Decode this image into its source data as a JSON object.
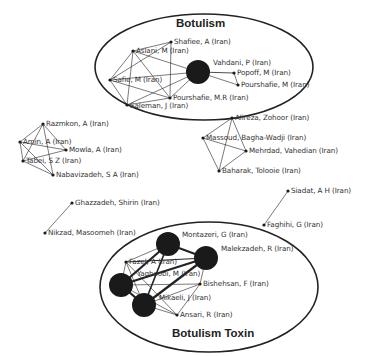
{
  "clusters": [
    {
      "id": "botulism",
      "title": "Botulism",
      "ellipse": {
        "cx": 204,
        "cy": 67,
        "rx": 109,
        "ry": 53
      }
    },
    {
      "id": "botulism-toxin",
      "title": "Botulism Toxin",
      "ellipse": {
        "cx": 209,
        "cy": 287,
        "rx": 109,
        "ry": 65
      }
    }
  ],
  "nodes": [
    {
      "id": "shafiee",
      "label": "Shafiee, A (Iran)",
      "x": 171,
      "y": 42,
      "r": 1.6
    },
    {
      "id": "aslani",
      "label": "Aslani, M (Iran)",
      "x": 133,
      "y": 51,
      "r": 1.6
    },
    {
      "id": "vahdani",
      "label": "Vahdani, P (Iran)",
      "x": 198,
      "y": 72,
      "r": 12
    },
    {
      "id": "popoff",
      "label": "Popoff, M (Iran)",
      "x": 234,
      "y": 73,
      "r": 1.6
    },
    {
      "id": "pourshafie_m",
      "label": "Pourshafie, M (Iran)",
      "x": 238,
      "y": 85,
      "r": 1.6
    },
    {
      "id": "safie",
      "label": "Safie, M (Iran)",
      "x": 110,
      "y": 80,
      "r": 1.6
    },
    {
      "id": "pourshafie_mr",
      "label": "Pourshafie, M.R (Iran)",
      "x": 170,
      "y": 98,
      "r": 1.6
    },
    {
      "id": "saleman",
      "label": "Saleman, J (Iran)",
      "x": 127,
      "y": 105,
      "r": 1.6
    },
    {
      "id": "alireza",
      "label": "Alireza, Zohoor (Iran)",
      "x": 232,
      "y": 118,
      "r": 1.6
    },
    {
      "id": "massoud",
      "label": "Massoud, Bagha-Wadji (Iran)",
      "x": 203,
      "y": 138,
      "r": 1.6
    },
    {
      "id": "mehrdad",
      "label": "Mehrdad, Vahedian (Iran)",
      "x": 246,
      "y": 151,
      "r": 1.6
    },
    {
      "id": "baharak",
      "label": "Baharak, Tolooie (Iran)",
      "x": 219,
      "y": 171,
      "r": 1.6
    },
    {
      "id": "razmkon",
      "label": "Razmkon, A (Iran)",
      "x": 43,
      "y": 124,
      "r": 1.6
    },
    {
      "id": "amin",
      "label": "Amin, A (Iran)",
      "x": 20,
      "y": 142,
      "r": 1.6
    },
    {
      "id": "mowla",
      "label": "Mowla, A (Iran)",
      "x": 66,
      "y": 150,
      "r": 1.6
    },
    {
      "id": "tabei",
      "label": "Tabei, S Z (Iran)",
      "x": 23,
      "y": 161,
      "r": 1.6
    },
    {
      "id": "nabavizadeh",
      "label": "Nabavizadeh, S A (Iran)",
      "x": 53,
      "y": 175,
      "r": 1.6
    },
    {
      "id": "ghazzadeh",
      "label": "Ghazzadeh, Shirin (Iran)",
      "x": 72,
      "y": 203,
      "r": 1.6
    },
    {
      "id": "nikzad",
      "label": "Nikzad, Masoomeh (Iran)",
      "x": 45,
      "y": 233,
      "r": 1.6
    },
    {
      "id": "siadat",
      "label": "Siadat, A H (Iran)",
      "x": 288,
      "y": 191,
      "r": 1.6
    },
    {
      "id": "faghihi",
      "label": "Faghihi, G (Iran)",
      "x": 264,
      "y": 225,
      "r": 1.6
    },
    {
      "id": "montazeri",
      "label": "Montazeri, G (Iran)",
      "x": 168,
      "y": 244,
      "r": 12
    },
    {
      "id": "malekzadeh",
      "label": "Malekzadeh, R (Iran)",
      "x": 206,
      "y": 258,
      "r": 12
    },
    {
      "id": "fazel",
      "label": "Fazel, A (Iran)",
      "x": 126,
      "y": 262,
      "r": 1.6
    },
    {
      "id": "yaghoobi",
      "label": "Yaghoobi, M (Iran)",
      "x": 121,
      "y": 285,
      "r": 12
    },
    {
      "id": "bishehsan",
      "label": "Bishehsan, F (Iran)",
      "x": 200,
      "y": 284,
      "r": 1.6
    },
    {
      "id": "mikaeli",
      "label": "Mikaeli, J (Iran)",
      "x": 144,
      "y": 305,
      "r": 12
    },
    {
      "id": "ansari",
      "label": "Ansari, R (Iran)",
      "x": 177,
      "y": 315,
      "r": 1.6
    }
  ],
  "labels": [
    {
      "node": "shafiee",
      "text": "Shafiee, A (Iran)",
      "x": 174,
      "y": 38
    },
    {
      "node": "aslani",
      "text": "Aslani, M (Iran)",
      "x": 136,
      "y": 47
    },
    {
      "node": "vahdani",
      "text": "Vahdani, P (Iran)",
      "x": 213,
      "y": 59
    },
    {
      "node": "popoff",
      "text": "Popoff, M (Iran)",
      "x": 237,
      "y": 69
    },
    {
      "node": "pourshafie_m",
      "text": "Pourshafie, M (Iran)",
      "x": 241,
      "y": 81
    },
    {
      "node": "safie",
      "text": "Safie, M (Iran)",
      "x": 113,
      "y": 76
    },
    {
      "node": "pourshafie_mr",
      "text": "Pourshafie, M.R (Iran)",
      "x": 173,
      "y": 94
    },
    {
      "node": "saleman",
      "text": "Saleman, J (Iran)",
      "x": 130,
      "y": 102
    },
    {
      "node": "alireza",
      "text": "Alireza, Zohoor (Iran)",
      "x": 235,
      "y": 114
    },
    {
      "node": "massoud",
      "text": "Massoud, Bagha-Wadji (Iran)",
      "x": 206,
      "y": 134
    },
    {
      "node": "mehrdad",
      "text": "Mehrdad, Vahedian (Iran)",
      "x": 249,
      "y": 147
    },
    {
      "node": "baharak",
      "text": "Baharak, Tolooie (Iran)",
      "x": 222,
      "y": 167
    },
    {
      "node": "razmkon",
      "text": "Razmkon, A (Iran)",
      "x": 46,
      "y": 120
    },
    {
      "node": "amin",
      "text": "Amin, A (Iran)",
      "x": 23,
      "y": 138
    },
    {
      "node": "mowla",
      "text": "Mowla, A (Iran)",
      "x": 69,
      "y": 146
    },
    {
      "node": "tabei",
      "text": "Tabei, S Z (Iran)",
      "x": 26,
      "y": 157
    },
    {
      "node": "nabavizadeh",
      "text": "Nabavizadeh, S A (Iran)",
      "x": 56,
      "y": 171
    },
    {
      "node": "ghazzadeh",
      "text": "Ghazzadeh, Shirin (Iran)",
      "x": 75,
      "y": 199
    },
    {
      "node": "nikzad",
      "text": "Nikzad, Masoomeh (Iran)",
      "x": 48,
      "y": 229
    },
    {
      "node": "siadat",
      "text": "Siadat, A H (Iran)",
      "x": 291,
      "y": 187
    },
    {
      "node": "faghihi",
      "text": "Faghihi, G (Iran)",
      "x": 267,
      "y": 221
    },
    {
      "node": "montazeri",
      "text": "Montazeri, G (Iran)",
      "x": 182,
      "y": 231
    },
    {
      "node": "malekzadeh",
      "text": "Malekzadeh, R (Iran)",
      "x": 221,
      "y": 245
    },
    {
      "node": "fazel",
      "text": "Fazel, A (Iran)",
      "x": 129,
      "y": 258
    },
    {
      "node": "yaghoobi",
      "text": "Yaghoobi, M (Iran)",
      "x": 137,
      "y": 270
    },
    {
      "node": "bishehsan",
      "text": "Bishehsan, F (Iran)",
      "x": 203,
      "y": 280
    },
    {
      "node": "mikaeli",
      "text": "Mikaeli, J (Iran)",
      "x": 159,
      "y": 294
    },
    {
      "node": "ansari",
      "text": "Ansari, R (Iran)",
      "x": 180,
      "y": 311
    }
  ],
  "edges": [
    [
      "shafiee",
      "aslani",
      0.6
    ],
    [
      "shafiee",
      "safie",
      0.6
    ],
    [
      "shafiee",
      "pourshafie_mr",
      0.6
    ],
    [
      "aslani",
      "vahdani",
      0.6
    ],
    [
      "aslani",
      "safie",
      0.6
    ],
    [
      "aslani",
      "saleman",
      0.6
    ],
    [
      "aslani",
      "pourshafie_mr",
      0.6
    ],
    [
      "safie",
      "vahdani",
      0.6
    ],
    [
      "safie",
      "pourshafie_mr",
      0.6
    ],
    [
      "safie",
      "saleman",
      0.6
    ],
    [
      "saleman",
      "vahdani",
      0.6
    ],
    [
      "saleman",
      "pourshafie_mr",
      0.6
    ],
    [
      "pourshafie_mr",
      "vahdani",
      0.6
    ],
    [
      "vahdani",
      "popoff",
      0.8
    ],
    [
      "vahdani",
      "pourshafie_m",
      0.6
    ],
    [
      "popoff",
      "pourshafie_m",
      0.6
    ],
    [
      "alireza",
      "massoud",
      0.6
    ],
    [
      "alireza",
      "baharak",
      0.6
    ],
    [
      "alireza",
      "mehrdad",
      0.6
    ],
    [
      "massoud",
      "mehrdad",
      0.6
    ],
    [
      "massoud",
      "baharak",
      0.6
    ],
    [
      "mehrdad",
      "baharak",
      0.6
    ],
    [
      "razmkon",
      "amin",
      0.6
    ],
    [
      "razmkon",
      "mowla",
      0.6
    ],
    [
      "razmkon",
      "tabei",
      0.6
    ],
    [
      "razmkon",
      "nabavizadeh",
      0.6
    ],
    [
      "amin",
      "tabei",
      0.6
    ],
    [
      "amin",
      "mowla",
      0.6
    ],
    [
      "amin",
      "nabavizadeh",
      0.6
    ],
    [
      "tabei",
      "mowla",
      0.6
    ],
    [
      "tabei",
      "nabavizadeh",
      0.6
    ],
    [
      "ghazzadeh",
      "nikzad",
      0.6
    ],
    [
      "siadat",
      "faghihi",
      0.6
    ],
    [
      "montazeri",
      "malekzadeh",
      2.2
    ],
    [
      "montazeri",
      "yaghoobi",
      2.2
    ],
    [
      "montazeri",
      "mikaeli",
      1.6
    ],
    [
      "montazeri",
      "fazel",
      0.6
    ],
    [
      "malekzadeh",
      "yaghoobi",
      2.2
    ],
    [
      "malekzadeh",
      "mikaeli",
      2.2
    ],
    [
      "malekzadeh",
      "fazel",
      1.2
    ],
    [
      "malekzadeh",
      "bishehsan",
      0.6
    ],
    [
      "yaghoobi",
      "mikaeli",
      2.2
    ],
    [
      "yaghoobi",
      "fazel",
      0.6
    ],
    [
      "yaghoobi",
      "bishehsan",
      0.6
    ],
    [
      "yaghoobi",
      "ansari",
      0.6
    ],
    [
      "mikaeli",
      "ansari",
      0.6
    ],
    [
      "mikaeli",
      "bishehsan",
      0.6
    ],
    [
      "mikaeli",
      "fazel",
      0.6
    ],
    [
      "fazel",
      "ansari",
      0.6
    ],
    [
      "ansari",
      "bishehsan",
      0.6
    ]
  ],
  "colors": {
    "ink": "#222222",
    "node": "#1a1a1a",
    "label": "#333333"
  }
}
